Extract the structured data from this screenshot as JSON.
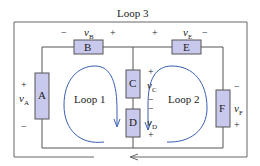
{
  "title": "Loop 3",
  "colors": {
    "wire": "#555555",
    "outer_wire": "#666666",
    "component_fill": "#c9c9ee",
    "component_stroke": "#555555",
    "loop_arrow": "#3a5fb0",
    "text": "#222222"
  },
  "components": {
    "A": {
      "label": "A",
      "voltage": "v",
      "sub": "A",
      "plus": "+",
      "minus": "−"
    },
    "B": {
      "label": "B",
      "voltage": "v",
      "sub": "B",
      "plus": "+",
      "minus": "−"
    },
    "C": {
      "label": "C",
      "voltage": "v",
      "sub": "C",
      "plus": "+",
      "minus": "−"
    },
    "D": {
      "label": "D",
      "voltage": "v",
      "sub": "D",
      "plus": "+",
      "minus": "−"
    },
    "E": {
      "label": "E",
      "voltage": "v",
      "sub": "E",
      "plus": "+",
      "minus": "−"
    },
    "F": {
      "label": "F",
      "voltage": "v",
      "sub": "F",
      "plus": "+",
      "minus": "−"
    }
  },
  "loops": {
    "loop1": "Loop 1",
    "loop2": "Loop 2",
    "loop3": "Loop 3"
  }
}
